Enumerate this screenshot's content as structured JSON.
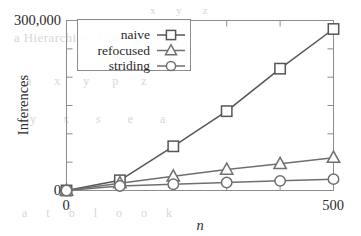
{
  "figure": {
    "background_ghost_text": {
      "heading": "a Hierarchical Filtering",
      "row1": "a   x   y   p   z",
      "row2": "y   x   s   e   a",
      "row3": "a   t   b   l   o   o   k",
      "top": "x   y   z"
    }
  },
  "chart_data": {
    "type": "line",
    "title": "",
    "xlabel": "n",
    "ylabel": "Inferences",
    "x": [
      0,
      100,
      200,
      300,
      400,
      500
    ],
    "xlim": [
      0,
      500
    ],
    "ylim": [
      0,
      300000
    ],
    "xticks": [
      0,
      100,
      200,
      300,
      400,
      500
    ],
    "xtick_labels": [
      "0",
      "",
      "",
      "",
      "",
      "500"
    ],
    "yticks": [
      0,
      50000,
      100000,
      150000,
      200000,
      250000,
      300000
    ],
    "ytick_labels": [
      "0",
      "",
      "",
      "",
      "",
      "",
      "300,000"
    ],
    "grid": false,
    "legend_position": "top-left-inside",
    "series": [
      {
        "name": "naive",
        "marker": "square",
        "color": "#555555",
        "values": [
          0,
          18000,
          78000,
          140000,
          215000,
          285000
        ]
      },
      {
        "name": "refocused",
        "marker": "triangle",
        "color": "#6f6f6f",
        "values": [
          0,
          13000,
          25000,
          37000,
          47000,
          58000
        ]
      },
      {
        "name": "striding",
        "marker": "circle",
        "color": "#6f6f6f",
        "values": [
          0,
          8000,
          11000,
          14000,
          17000,
          20000
        ]
      }
    ]
  }
}
